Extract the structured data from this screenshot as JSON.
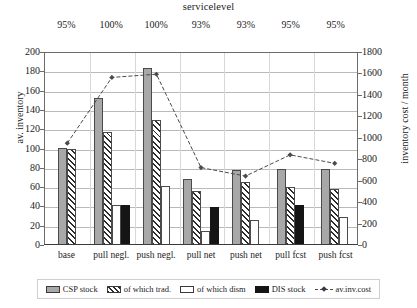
{
  "chart_data": {
    "type": "bar",
    "title": "servicelevel",
    "xlabel": "",
    "ylabel": "av. inventory",
    "y2label": "inventory cost / month",
    "ylim": [
      0,
      200
    ],
    "y2lim": [
      0,
      1800
    ],
    "y_ticks": [
      0,
      20,
      40,
      60,
      80,
      100,
      120,
      140,
      160,
      180,
      200
    ],
    "y2_ticks": [
      0,
      200,
      400,
      600,
      800,
      1000,
      1200,
      1400,
      1600,
      1800
    ],
    "grid": true,
    "legend_position": "bottom",
    "categories": [
      "base",
      "pull negl.",
      "push negl.",
      "pull net",
      "push net",
      "pull fcst",
      "push fcst"
    ],
    "top_labels": [
      "95%",
      "100%",
      "100%",
      "93%",
      "93%",
      "95%",
      "95%"
    ],
    "series": [
      {
        "name": "CSP stock",
        "axis": "left",
        "values": [
          100,
          151,
          182,
          67,
          77,
          78,
          78
        ]
      },
      {
        "name": "of which trad.",
        "axis": "left",
        "values": [
          98,
          116,
          128,
          55,
          64,
          59,
          57
        ]
      },
      {
        "name": "of which dism",
        "axis": "left",
        "values": [
          0,
          40,
          60,
          13,
          25,
          0,
          28
        ]
      },
      {
        "name": "DIS stock",
        "axis": "left",
        "values": [
          0,
          40,
          0,
          38,
          0,
          40,
          0
        ]
      },
      {
        "name": "av.inv.cost",
        "axis": "right",
        "type": "line",
        "values": [
          950,
          1570,
          1600,
          720,
          640,
          840,
          760
        ]
      }
    ]
  },
  "legend": {
    "items": [
      {
        "label": "CSP stock",
        "swatch": "csp-swatch"
      },
      {
        "label": "of which trad.",
        "swatch": "trad-swatch"
      },
      {
        "label": "of which dism",
        "swatch": "dism-swatch"
      },
      {
        "label": "DIS stock",
        "swatch": "dis-swatch"
      },
      {
        "label": "av.inv.cost",
        "swatch": "line-swatch"
      }
    ]
  },
  "colors": {
    "csp": "#a8a8a8",
    "dis": "#151515",
    "dism": "#ffffff",
    "line": "#4a4a4a",
    "grid": "#b9b9b9",
    "axis": "#3a3a3a"
  }
}
